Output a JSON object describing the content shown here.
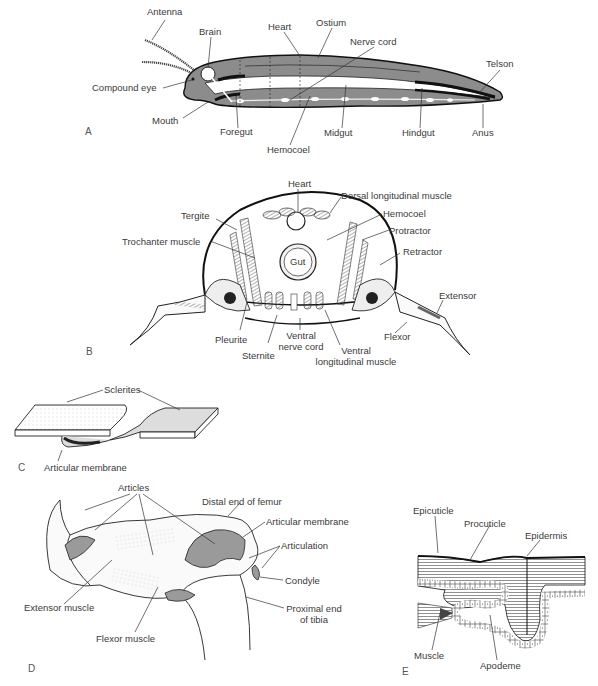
{
  "figure": {
    "panels": {
      "A": {
        "letter": "A",
        "subject": "Insect body, longitudinal section",
        "labels": {
          "antenna": "Antenna",
          "brain": "Brain",
          "heart": "Heart",
          "ostium": "Ostium",
          "nerve_cord": "Nerve cord",
          "telson": "Telson",
          "compound_eye": "Compound eye",
          "mouth": "Mouth",
          "foregut": "Foregut",
          "hemocoel": "Hemocoel",
          "midgut": "Midgut",
          "hindgut": "Hindgut",
          "anus": "Anus"
        }
      },
      "B": {
        "letter": "B",
        "subject": "Insect thorax, cross section",
        "labels": {
          "heart": "Heart",
          "dorsal_longitudinal_muscle": "Dorsal longitudinal muscle",
          "tergite": "Tergite",
          "hemocoel": "Hemocoel",
          "protractor": "Protractor",
          "trochanter_muscle": "Trochanter muscle",
          "gut": "Gut",
          "retractor": "Retractor",
          "extensor": "Extensor",
          "flexor": "Flexor",
          "pleurite": "Pleurite",
          "sternite": "Sternite",
          "ventral_nerve_cord_1": "Ventral",
          "ventral_nerve_cord_2": "nerve cord",
          "ventral_longitudinal_muscle_1": "Ventral",
          "ventral_longitudinal_muscle_2": "longitudinal muscle"
        }
      },
      "C": {
        "letter": "C",
        "subject": "Sclerites joined by articular membrane",
        "labels": {
          "sclerites": "Sclerites",
          "articular_membrane": "Articular membrane"
        }
      },
      "D": {
        "letter": "D",
        "subject": "Leg joint, femur-tibia",
        "labels": {
          "articles": "Articles",
          "distal_end_of_femur": "Distal end of femur",
          "articular_membrane": "Articular membrane",
          "articulation": "Articulation",
          "condyle": "Condyle",
          "extensor_muscle": "Extensor muscle",
          "flexor_muscle": "Flexor muscle",
          "proximal_end_of_tibia_1": "Proximal end",
          "proximal_end_of_tibia_2": "of tibia"
        }
      },
      "E": {
        "letter": "E",
        "subject": "Cuticle and apodeme section",
        "labels": {
          "epicuticle": "Epicuticle",
          "procuticle": "Procuticle",
          "epidermis": "Epidermis",
          "muscle": "Muscle",
          "apodeme": "Apodeme"
        }
      }
    },
    "colors": {
      "ink": "#2a2a2a",
      "body_gray": "#8c8c8c",
      "membrane_gray": "#9a9a9a",
      "light_fill": "#e6e6e6",
      "background": "#ffffff"
    }
  }
}
